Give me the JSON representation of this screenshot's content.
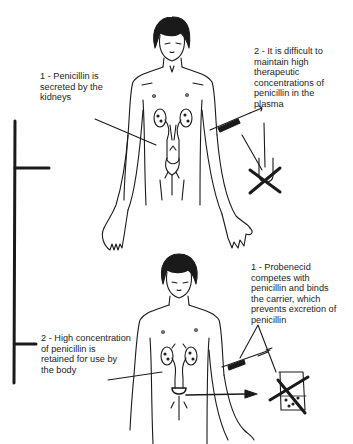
{
  "diagram": {
    "top_panel": {
      "label_1": "1 - Penicillin is\nsecreted by the\nkidneys",
      "label_2": "2 - It is difficult to\nmaintain high\ntherapeutic\nconcentrations of\npenicillin in the\nplasma"
    },
    "bottom_panel": {
      "label_1": "1 - Probenecid\ncompetes with\npenicillin and binds\nthe carrier, which\nprevents excretion of\npenicillin",
      "label_2": "2 - High concentration\nof penicillin is\nretained for use by\nthe body"
    },
    "colors": {
      "ink": "#1a1a1a",
      "background": "#ffffff"
    }
  }
}
